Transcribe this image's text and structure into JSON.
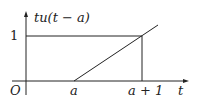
{
  "diagram": {
    "y_label": "tu(t − a)",
    "x_label": "t",
    "origin_label": "O",
    "y_tick_label": "1",
    "x_tick_labels": [
      "a",
      "a + 1"
    ],
    "colors": {
      "stroke": "#222222",
      "background": "#ffffff"
    }
  }
}
